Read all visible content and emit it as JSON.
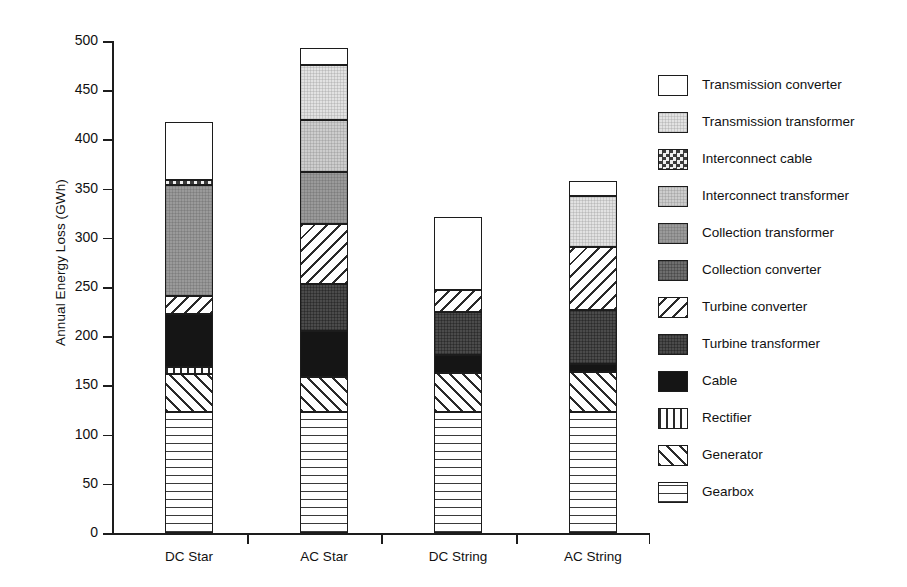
{
  "chart_data": {
    "type": "bar",
    "subtype": "stacked",
    "title": "",
    "xlabel": "",
    "ylabel": "Annual Energy Loss (GWh)",
    "ylim": [
      0,
      500
    ],
    "yticks": [
      0,
      50,
      100,
      150,
      200,
      250,
      300,
      350,
      400,
      450,
      500
    ],
    "grid": false,
    "legend_position": "right",
    "categories": [
      "DC Star",
      "AC Star",
      "DC String",
      "AC String"
    ],
    "series": [
      {
        "name": "Gearbox",
        "pattern": "grid",
        "values": [
          123,
          123,
          123,
          123
        ]
      },
      {
        "name": "Generator",
        "pattern": "fwdhatch",
        "values": [
          39,
          36,
          40,
          41
        ]
      },
      {
        "name": "Rectifier",
        "pattern": "vertical",
        "values": [
          7,
          0,
          0,
          0
        ]
      },
      {
        "name": "Cable",
        "pattern": "black",
        "values": [
          54,
          46,
          18,
          8
        ]
      },
      {
        "name": "Turbine transformer",
        "pattern": "darkergray",
        "values": [
          0,
          48,
          44,
          55
        ]
      },
      {
        "name": "Turbine converter",
        "pattern": "backhatch",
        "values": [
          18,
          61,
          22,
          64
        ]
      },
      {
        "name": "Collection converter",
        "pattern": "darkgray",
        "values": [
          0,
          0,
          0,
          0
        ]
      },
      {
        "name": "Collection transformer",
        "pattern": "midgray",
        "values": [
          113,
          53,
          0,
          0
        ]
      },
      {
        "name": "Interconnect transformer",
        "pattern": "lightgray",
        "values": [
          0,
          53,
          0,
          0
        ]
      },
      {
        "name": "Interconnect cable",
        "pattern": "checker",
        "values": [
          5,
          0,
          0,
          0
        ]
      },
      {
        "name": "Transmission transformer",
        "pattern": "vlightgray",
        "values": [
          0,
          56,
          0,
          52
        ]
      },
      {
        "name": "Transmission converter",
        "pattern": "white",
        "values": [
          59,
          17,
          74,
          15
        ]
      }
    ],
    "totals": [
      387,
      485,
      321,
      357
    ],
    "legend_order": [
      "Transmission converter",
      "Transmission transformer",
      "Interconnect cable",
      "Interconnect transformer",
      "Collection transformer",
      "Collection converter",
      "Turbine converter",
      "Turbine transformer",
      "Cable",
      "Rectifier",
      "Generator",
      "Gearbox"
    ],
    "legend_patterns": {
      "Transmission converter": "white",
      "Transmission transformer": "vlightgray",
      "Interconnect cable": "checker",
      "Interconnect transformer": "lightgray",
      "Collection transformer": "midgray",
      "Collection converter": "darkgray",
      "Turbine converter": "backhatch",
      "Turbine transformer": "darkergray",
      "Cable": "black",
      "Rectifier": "vertical",
      "Generator": "fwdhatch",
      "Gearbox": "grid"
    }
  }
}
